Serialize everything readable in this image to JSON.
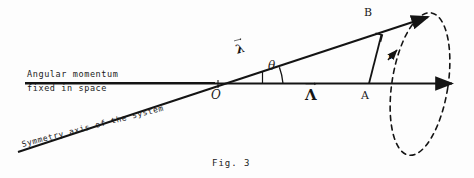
{
  "figure": {
    "caption": "Fig. 3",
    "axis_label_line1": "Angular momentum",
    "axis_label_line2": "fixed in space",
    "symmetry_axis_label": "Symmetry axis of the system",
    "point_o": "O",
    "point_a": "A",
    "point_b": "B",
    "angle_label": "θ",
    "vector_lambda_axis": "λ",
    "vector_lambda_main": "Λ",
    "vector_r": "r",
    "ink_color": "#141414",
    "background_color": "#fdfdfd"
  }
}
